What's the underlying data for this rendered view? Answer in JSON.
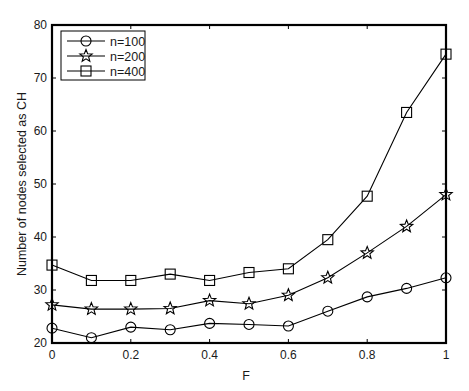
{
  "chart_data": {
    "type": "line",
    "title": "",
    "xlabel": "F",
    "ylabel": "Number of nodes selected as CH",
    "x": [
      0,
      0.1,
      0.2,
      0.3,
      0.4,
      0.5,
      0.6,
      0.7,
      0.8,
      0.9,
      1.0
    ],
    "xlim": [
      0,
      1
    ],
    "ylim": [
      20,
      80
    ],
    "xticks": [
      0,
      0.2,
      0.4,
      0.6,
      0.8,
      1
    ],
    "xtick_labels": [
      "0",
      "0.2",
      "0.4",
      "0.6",
      "0.8",
      "1"
    ],
    "yticks": [
      20,
      30,
      40,
      50,
      60,
      70,
      80
    ],
    "ytick_labels": [
      "20",
      "30",
      "40",
      "50",
      "60",
      "70",
      "80"
    ],
    "grid": false,
    "legend_position": "upper left",
    "series": [
      {
        "name": "n=100",
        "marker": "circle",
        "color": "#000000",
        "values": [
          22.8,
          21.0,
          23.0,
          22.5,
          23.7,
          23.5,
          23.2,
          26.0,
          28.7,
          30.3,
          32.3
        ]
      },
      {
        "name": "n=200",
        "marker": "star",
        "color": "#000000",
        "values": [
          27.2,
          26.4,
          26.4,
          26.5,
          28.0,
          27.4,
          29.0,
          32.3,
          37.0,
          42.0,
          48.0
        ]
      },
      {
        "name": "n=400",
        "marker": "square",
        "color": "#000000",
        "values": [
          34.7,
          31.8,
          31.8,
          33.0,
          31.8,
          33.3,
          34.0,
          39.5,
          47.7,
          63.5,
          74.5
        ]
      }
    ]
  },
  "legend": {
    "items": [
      "n=100",
      "n=200",
      "n=400"
    ]
  },
  "axes": {
    "xlabel": "F",
    "ylabel": "Number of nodes selected as CH"
  }
}
